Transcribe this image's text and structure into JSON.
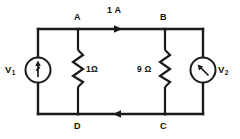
{
  "figure": {
    "type": "electrical-circuit-schematic",
    "background_color": "#ffffff",
    "line_color": "#1a1a1a"
  },
  "nodes": {
    "a": "A",
    "b": "B",
    "c": "C",
    "d": "D"
  },
  "current": {
    "top_label": "1 A",
    "top_direction": "right",
    "bottom_direction": "left"
  },
  "resistors": [
    {
      "id": "r1",
      "label": "1Ω",
      "value": 1,
      "unit": "Ω",
      "between": "A-D"
    },
    {
      "id": "r2",
      "label": "9 Ω",
      "value": 9,
      "unit": "Ω",
      "between": "B-C"
    }
  ],
  "sources": [
    {
      "id": "v1",
      "name": "V",
      "subscript": "1",
      "symbol": "current-source-circle",
      "side": "left"
    },
    {
      "id": "v2",
      "name": "V",
      "subscript": "2",
      "symbol": "current-source-circle",
      "side": "right"
    }
  ]
}
